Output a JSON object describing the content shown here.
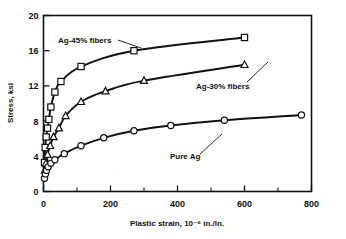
{
  "chart_data": {
    "type": "line",
    "title": "",
    "xlabel": "Plastic strain, 10⁻⁶ in./in.",
    "ylabel": "Stress, ksi",
    "xlim": [
      0,
      800
    ],
    "ylim": [
      0,
      20
    ],
    "xticks": [
      0,
      200,
      400,
      600,
      800
    ],
    "xticklabels": [
      "0",
      "200",
      "400",
      "600",
      "800"
    ],
    "xminorticks": [
      100,
      300,
      500,
      700
    ],
    "yticks": [
      0,
      4,
      8,
      12,
      16,
      20
    ],
    "yticklabels": [
      "0",
      "4",
      "8",
      "12",
      "16",
      "20"
    ],
    "grid": false,
    "legend_position": "inline-annotations",
    "series": [
      {
        "name": "Ag-45% fibers",
        "marker": "square",
        "annotation": "Ag-45% fibers",
        "points": [
          {
            "x": 3,
            "y": 3.3
          },
          {
            "x": 5,
            "y": 5.0
          },
          {
            "x": 8,
            "y": 6.2
          },
          {
            "x": 12,
            "y": 7.2
          },
          {
            "x": 16,
            "y": 8.2
          },
          {
            "x": 22,
            "y": 9.6
          },
          {
            "x": 34,
            "y": 11.3
          },
          {
            "x": 52,
            "y": 12.5
          },
          {
            "x": 112,
            "y": 14.2
          },
          {
            "x": 270,
            "y": 16.0
          },
          {
            "x": 600,
            "y": 17.5
          }
        ]
      },
      {
        "name": "Ag-30% fibers",
        "marker": "triangle",
        "annotation": "Ag-30% fibers",
        "points": [
          {
            "x": 4,
            "y": 2.4
          },
          {
            "x": 7,
            "y": 3.2
          },
          {
            "x": 12,
            "y": 4.2
          },
          {
            "x": 20,
            "y": 5.2
          },
          {
            "x": 30,
            "y": 6.2
          },
          {
            "x": 46,
            "y": 7.2
          },
          {
            "x": 66,
            "y": 8.6
          },
          {
            "x": 112,
            "y": 10.2
          },
          {
            "x": 185,
            "y": 11.4
          },
          {
            "x": 300,
            "y": 12.6
          },
          {
            "x": 600,
            "y": 14.4
          }
        ]
      },
      {
        "name": "Pure Ag",
        "marker": "circle",
        "annotation": "Pure Ag",
        "points": [
          {
            "x": 3,
            "y": 1.5
          },
          {
            "x": 6,
            "y": 2.0
          },
          {
            "x": 9,
            "y": 2.4
          },
          {
            "x": 14,
            "y": 2.8
          },
          {
            "x": 22,
            "y": 3.2
          },
          {
            "x": 34,
            "y": 3.6
          },
          {
            "x": 62,
            "y": 4.3
          },
          {
            "x": 112,
            "y": 5.2
          },
          {
            "x": 180,
            "y": 6.1
          },
          {
            "x": 270,
            "y": 6.9
          },
          {
            "x": 380,
            "y": 7.5
          },
          {
            "x": 540,
            "y": 8.1
          },
          {
            "x": 770,
            "y": 8.7
          }
        ]
      }
    ]
  }
}
